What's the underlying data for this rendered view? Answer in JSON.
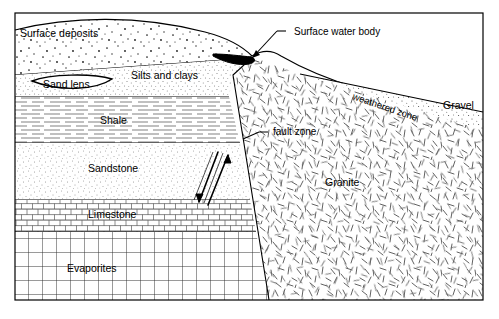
{
  "figure": {
    "background_color": "#ffffff",
    "line_color": "#000000",
    "frame": {
      "x": 15,
      "y": 13,
      "width": 468,
      "height": 287
    }
  },
  "units": [
    {
      "id": "surface-deposits",
      "label": "Surface deposits",
      "pattern": "stipple-coarse",
      "label_x": 20,
      "label_y": 37
    },
    {
      "id": "silts-and-clays",
      "label": "Silts and clays",
      "pattern": "stipple-fine",
      "label_x": 131,
      "label_y": 79
    },
    {
      "id": "sand-lens",
      "label": "Sand lens",
      "pattern": "blank",
      "label_x": 43,
      "label_y": 88
    },
    {
      "id": "shale",
      "label": "Shale",
      "pattern": "horizontal-dashes",
      "label_x": 100,
      "label_y": 124
    },
    {
      "id": "sandstone",
      "label": "Sandstone",
      "pattern": "stipple-fine",
      "label_x": 88,
      "label_y": 172
    },
    {
      "id": "limestone",
      "label": "Limestone",
      "pattern": "brick",
      "label_x": 88,
      "label_y": 218
    },
    {
      "id": "evaporites",
      "label": "Evaporites",
      "pattern": "grid",
      "label_x": 67,
      "label_y": 272
    },
    {
      "id": "granite",
      "label": "Granite",
      "pattern": "random-dashes",
      "label_x": 325,
      "label_y": 186
    },
    {
      "id": "gravel",
      "label": "Gravel",
      "pattern": "stipple-fine",
      "label_x": 443,
      "label_y": 109
    },
    {
      "id": "weathered-zone",
      "label": "weathered zone",
      "pattern": "none",
      "label_x": 352,
      "label_y": 99,
      "rotation": 19
    },
    {
      "id": "surface-water-body",
      "label": "Surface water body",
      "pattern": "solid-black",
      "label_x": 294,
      "label_y": 35
    },
    {
      "id": "fault-zone",
      "label": "fault zone",
      "pattern": "none",
      "label_x": 273,
      "label_y": 135
    }
  ],
  "callouts": [
    {
      "id": "surface-water-body-callout",
      "label": "Surface water body",
      "leader_from": [
        286,
        31
      ],
      "leader_to": [
        252,
        58
      ]
    },
    {
      "id": "fault-zone-callout",
      "label": "fault zone",
      "leader_from": [
        268,
        132
      ],
      "leader_to": [
        243,
        139
      ]
    }
  ],
  "fault": {
    "id": "fault-zone-indicator",
    "upthrow_side": "right",
    "downthrow_side": "left",
    "arrows": [
      {
        "direction": "up",
        "side": "right"
      },
      {
        "direction": "down",
        "side": "left"
      }
    ]
  },
  "colors": {
    "ink": "#000000",
    "paper": "#ffffff",
    "water": "#000000",
    "hatch": "#555555"
  }
}
